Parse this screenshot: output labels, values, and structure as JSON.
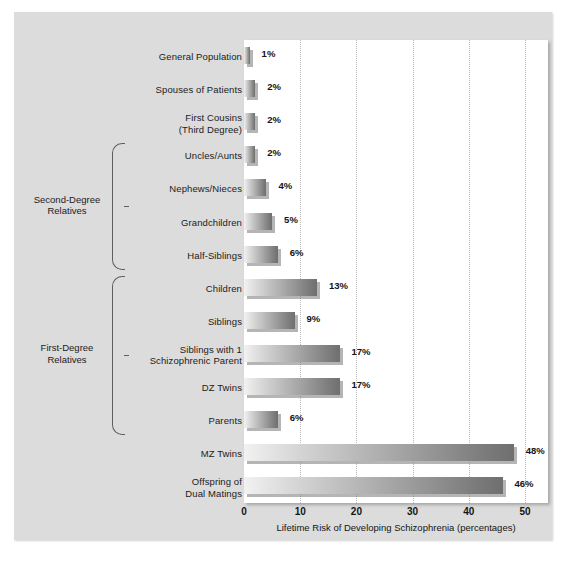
{
  "chart_data": {
    "type": "bar",
    "orientation": "horizontal",
    "title": "",
    "xlabel": "Lifetime Risk of Developing Schizophrenia (percentages)",
    "ylabel": "",
    "xlim": [
      0,
      55
    ],
    "xticks": [
      0,
      10,
      20,
      30,
      40,
      50
    ],
    "xtick_labels": [
      "0",
      "10",
      "20",
      "30",
      "40",
      "50"
    ],
    "grid": "vertical-dotted",
    "legend": "none",
    "categories": [
      "General Population",
      "Spouses of Patients",
      "First Cousins (Third Degree)",
      "Uncles/Aunts",
      "Nephews/Nieces",
      "Grandchildren",
      "Half-Siblings",
      "Children",
      "Siblings",
      "Siblings with 1 Schizophrenic Parent",
      "DZ Twins",
      "Parents",
      "MZ Twins",
      "Offspring of Dual Matings"
    ],
    "values": [
      1,
      2,
      2,
      2,
      4,
      5,
      6,
      13,
      9,
      17,
      17,
      6,
      48,
      46
    ],
    "value_labels": [
      "1%",
      "2%",
      "2%",
      "2%",
      "4%",
      "5%",
      "6%",
      "13%",
      "9%",
      "17%",
      "17%",
      "6%",
      "48%",
      "46%"
    ],
    "groups": [
      {
        "label": "Second-Degree Relatives",
        "first_index": 3,
        "last_index": 6
      },
      {
        "label": "First-Degree Relatives",
        "first_index": 7,
        "last_index": 11
      }
    ]
  },
  "rows": [
    {
      "label_line1": "General Population",
      "label_line2": "",
      "value_label": "1%",
      "value": 1
    },
    {
      "label_line1": "Spouses of Patients",
      "label_line2": "",
      "value_label": "2%",
      "value": 2
    },
    {
      "label_line1": "First Cousins",
      "label_line2": "(Third Degree)",
      "value_label": "2%",
      "value": 2
    },
    {
      "label_line1": "Uncles/Aunts",
      "label_line2": "",
      "value_label": "2%",
      "value": 2
    },
    {
      "label_line1": "Nephews/Nieces",
      "label_line2": "",
      "value_label": "4%",
      "value": 4
    },
    {
      "label_line1": "Grandchildren",
      "label_line2": "",
      "value_label": "5%",
      "value": 5
    },
    {
      "label_line1": "Half-Siblings",
      "label_line2": "",
      "value_label": "6%",
      "value": 6
    },
    {
      "label_line1": "Children",
      "label_line2": "",
      "value_label": "13%",
      "value": 13
    },
    {
      "label_line1": "Siblings",
      "label_line2": "",
      "value_label": "9%",
      "value": 9
    },
    {
      "label_line1": "Siblings with 1",
      "label_line2": "Schizophrenic Parent",
      "value_label": "17%",
      "value": 17
    },
    {
      "label_line1": "DZ Twins",
      "label_line2": "",
      "value_label": "17%",
      "value": 17
    },
    {
      "label_line1": "Parents",
      "label_line2": "",
      "value_label": "6%",
      "value": 6
    },
    {
      "label_line1": "MZ Twins",
      "label_line2": "",
      "value_label": "48%",
      "value": 48
    },
    {
      "label_line1": "Offspring of",
      "label_line2": "Dual Matings",
      "value_label": "46%",
      "value": 46
    }
  ],
  "groups": [
    {
      "label_line1": "Second-Degree",
      "label_line2": "Relatives"
    },
    {
      "label_line1": "First-Degree",
      "label_line2": "Relatives"
    }
  ],
  "axis": {
    "ticks": [
      "0",
      "10",
      "20",
      "30",
      "40",
      "50"
    ],
    "title": "Lifetime Risk of Developing Schizophrenia (percentages)"
  },
  "colors": {
    "panel_background": "#dcdcdc",
    "plot_background": "#ffffff",
    "bar_light": "#f2f2f2",
    "bar_dark": "#6f6f6f",
    "gridline": "#b9b9b9",
    "text": "#141414"
  }
}
